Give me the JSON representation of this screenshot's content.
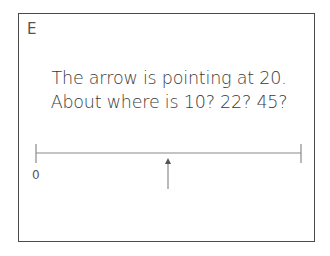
{
  "card": {
    "label": "E",
    "prompt_lines": [
      "The arrow is pointing at 20.",
      "About where is 10? 22? 45?"
    ]
  },
  "number_line": {
    "start_label": "0",
    "end_label": "",
    "arrow_value": "20",
    "line_color": "#8a8a8a",
    "border_color": "#4a4a4a"
  }
}
